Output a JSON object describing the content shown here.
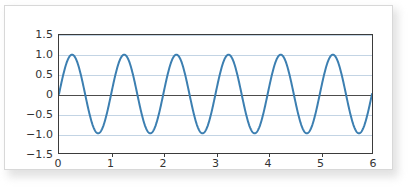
{
  "figure": {
    "background_color": "#ffffff",
    "card_border_color": "#d8d8d8",
    "axis_color": "#3b3b3b",
    "grid_color": "#c3d4e4",
    "zero_line_color": "#4c4c4c",
    "curve_color": "#3c7fb1"
  },
  "chart_data": {
    "type": "line",
    "title": "",
    "subtitle": "",
    "xlabel": "",
    "ylabel": "",
    "legend": [],
    "legend_position": "none",
    "grid": true,
    "grid_axis": "y",
    "xlim": [
      0,
      6
    ],
    "ylim": [
      -1.5,
      1.5
    ],
    "xticks": [
      0,
      1,
      2,
      3,
      4,
      5,
      6
    ],
    "xticklabels": [
      "0",
      "1",
      "2",
      "3",
      "4",
      "5",
      "6"
    ],
    "yticks": [
      1.5,
      1.0,
      0.5,
      0,
      -0.5,
      -1.0,
      -1.5
    ],
    "yticklabels": [
      "1.5",
      "1.0",
      "0.5",
      "0",
      "−0.5",
      "−1.0",
      "−1.5"
    ],
    "series": [
      {
        "name": "sin(2πt)",
        "color": "#3c7fb1",
        "linewidth": 2,
        "function": "sin(2*pi*x)",
        "amplitude": 1.0,
        "period": 1.0,
        "phase": 0.0,
        "cycles": 6,
        "x": [
          0,
          0.25,
          0.5,
          0.75,
          1,
          1.25,
          1.5,
          1.75,
          2,
          2.25,
          2.5,
          2.75,
          3,
          3.25,
          3.5,
          3.75,
          4,
          4.25,
          4.5,
          4.75,
          5,
          5.25,
          5.5,
          5.75,
          6
        ],
        "values": [
          0,
          1,
          0,
          -1,
          0,
          1,
          0,
          -1,
          0,
          1,
          0,
          -1,
          0,
          1,
          0,
          -1,
          0,
          1,
          0,
          -1,
          0,
          1,
          0,
          -1,
          0
        ]
      }
    ],
    "annotations": []
  }
}
